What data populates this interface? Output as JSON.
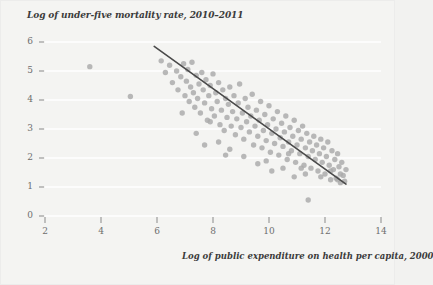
{
  "chart_data": {
    "type": "scatter",
    "title": "Log of under-five mortality rate, 2010–2011",
    "xlabel": "Log of public expenditure on health per capita, 2000",
    "ylabel": "",
    "xlim": [
      2,
      14
    ],
    "ylim": [
      0,
      6
    ],
    "xticks": [
      2,
      4,
      6,
      8,
      10,
      12,
      14
    ],
    "yticks": [
      0,
      1,
      2,
      3,
      4,
      5,
      6
    ],
    "grid": "horizontal",
    "legend": "none",
    "point_color": "#a9a9a9",
    "line_color": "#4a4a4a",
    "trendline": {
      "x0": 5.9,
      "y0": 5.85,
      "x1": 12.75,
      "y1": 1.1
    },
    "points": [
      [
        3.6,
        5.15
      ],
      [
        5.05,
        4.12
      ],
      [
        6.15,
        5.35
      ],
      [
        6.3,
        4.95
      ],
      [
        6.45,
        5.2
      ],
      [
        6.55,
        4.6
      ],
      [
        6.7,
        5.0
      ],
      [
        6.75,
        4.35
      ],
      [
        6.85,
        4.8
      ],
      [
        6.95,
        5.25
      ],
      [
        7.0,
        4.15
      ],
      [
        7.05,
        4.65
      ],
      [
        7.1,
        5.05
      ],
      [
        7.15,
        3.95
      ],
      [
        7.2,
        4.45
      ],
      [
        7.25,
        5.3
      ],
      [
        7.3,
        4.25
      ],
      [
        7.35,
        3.75
      ],
      [
        7.4,
        4.85
      ],
      [
        7.45,
        4.05
      ],
      [
        7.5,
        4.55
      ],
      [
        7.55,
        3.55
      ],
      [
        7.6,
        4.95
      ],
      [
        7.65,
        4.35
      ],
      [
        7.7,
        3.9
      ],
      [
        7.75,
        4.7
      ],
      [
        7.8,
        3.3
      ],
      [
        7.85,
        4.15
      ],
      [
        7.9,
        4.5
      ],
      [
        7.95,
        3.7
      ],
      [
        8.0,
        4.9
      ],
      [
        8.05,
        3.45
      ],
      [
        8.1,
        4.25
      ],
      [
        8.15,
        3.95
      ],
      [
        8.2,
        4.6
      ],
      [
        8.25,
        3.15
      ],
      [
        8.3,
        3.65
      ],
      [
        8.35,
        4.35
      ],
      [
        8.4,
        2.95
      ],
      [
        8.45,
        4.05
      ],
      [
        8.5,
        3.4
      ],
      [
        8.55,
        3.85
      ],
      [
        8.6,
        4.45
      ],
      [
        8.65,
        3.1
      ],
      [
        8.7,
        3.6
      ],
      [
        8.75,
        4.15
      ],
      [
        8.8,
        2.8
      ],
      [
        8.85,
        3.35
      ],
      [
        8.9,
        3.9
      ],
      [
        8.95,
        4.55
      ],
      [
        9.0,
        3.05
      ],
      [
        9.05,
        3.55
      ],
      [
        9.1,
        2.65
      ],
      [
        9.15,
        4.05
      ],
      [
        9.2,
        3.25
      ],
      [
        9.25,
        3.75
      ],
      [
        9.3,
        2.9
      ],
      [
        9.35,
        3.45
      ],
      [
        9.4,
        4.2
      ],
      [
        9.45,
        2.45
      ],
      [
        9.5,
        3.1
      ],
      [
        9.55,
        3.65
      ],
      [
        9.6,
        2.75
      ],
      [
        9.65,
        3.3
      ],
      [
        9.7,
        3.95
      ],
      [
        9.75,
        2.35
      ],
      [
        9.8,
        2.95
      ],
      [
        9.85,
        3.5
      ],
      [
        9.9,
        2.6
      ],
      [
        9.95,
        3.15
      ],
      [
        10.0,
        3.8
      ],
      [
        10.05,
        2.2
      ],
      [
        10.1,
        2.85
      ],
      [
        10.15,
        3.35
      ],
      [
        10.2,
        2.5
      ],
      [
        10.25,
        3.0
      ],
      [
        10.3,
        3.6
      ],
      [
        10.35,
        2.1
      ],
      [
        10.4,
        2.7
      ],
      [
        10.45,
        3.2
      ],
      [
        10.5,
        2.4
      ],
      [
        10.55,
        2.9
      ],
      [
        10.6,
        3.45
      ],
      [
        10.65,
        1.95
      ],
      [
        10.7,
        2.55
      ],
      [
        10.75,
        3.05
      ],
      [
        10.8,
        2.25
      ],
      [
        10.85,
        2.75
      ],
      [
        10.9,
        3.3
      ],
      [
        10.95,
        1.85
      ],
      [
        11.0,
        2.45
      ],
      [
        11.05,
        2.95
      ],
      [
        11.1,
        2.15
      ],
      [
        11.15,
        2.65
      ],
      [
        11.2,
        3.1
      ],
      [
        11.25,
        1.75
      ],
      [
        11.3,
        2.35
      ],
      [
        11.35,
        2.85
      ],
      [
        11.4,
        2.05
      ],
      [
        11.45,
        2.55
      ],
      [
        11.5,
        1.65
      ],
      [
        11.55,
        2.25
      ],
      [
        11.6,
        2.75
      ],
      [
        11.65,
        1.95
      ],
      [
        11.7,
        2.45
      ],
      [
        11.75,
        1.55
      ],
      [
        11.8,
        2.15
      ],
      [
        11.85,
        2.65
      ],
      [
        11.9,
        1.85
      ],
      [
        11.95,
        2.35
      ],
      [
        12.0,
        1.45
      ],
      [
        12.05,
        2.05
      ],
      [
        12.1,
        2.55
      ],
      [
        12.15,
        1.75
      ],
      [
        12.2,
        1.25
      ],
      [
        12.25,
        2.25
      ],
      [
        12.3,
        1.6
      ],
      [
        12.35,
        1.95
      ],
      [
        12.4,
        1.3
      ],
      [
        12.45,
        2.15
      ],
      [
        12.5,
        1.7
      ],
      [
        12.55,
        1.15
      ],
      [
        12.6,
        1.85
      ],
      [
        12.65,
        1.4
      ],
      [
        12.7,
        1.2
      ],
      [
        12.75,
        1.6
      ],
      [
        11.4,
        0.55
      ],
      [
        8.2,
        2.55
      ],
      [
        8.6,
        2.3
      ],
      [
        9.1,
        2.05
      ],
      [
        9.6,
        1.8
      ],
      [
        10.1,
        1.55
      ],
      [
        7.4,
        2.85
      ],
      [
        7.9,
        3.25
      ],
      [
        6.9,
        3.55
      ],
      [
        10.9,
        1.35
      ],
      [
        11.3,
        1.45
      ],
      [
        10.5,
        1.65
      ],
      [
        9.9,
        1.9
      ],
      [
        12.45,
        1.25
      ],
      [
        12.55,
        1.45
      ],
      [
        12.2,
        1.55
      ],
      [
        11.85,
        1.35
      ],
      [
        8.45,
        2.1
      ],
      [
        7.7,
        2.45
      ],
      [
        10.7,
        2.15
      ],
      [
        11.15,
        1.65
      ]
    ]
  }
}
